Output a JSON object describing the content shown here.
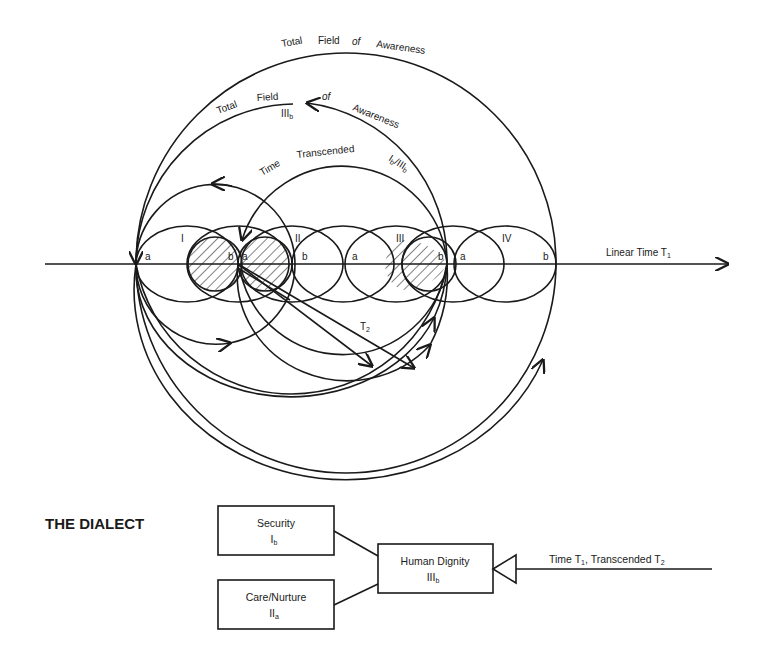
{
  "diagram": {
    "axis": {
      "label": "Linear Time T",
      "label_sub": "1"
    },
    "arcs": {
      "outer_label_words": [
        "Total",
        "Field",
        "of",
        "Awareness"
      ],
      "middle_label_left_words": [
        "Total",
        "Field"
      ],
      "middle_label_right_words": [
        "of",
        "Awareness"
      ],
      "middle_marker": "III",
      "middle_marker_sub": "b",
      "inner_label_words": [
        "Time",
        "Transcended"
      ],
      "inner_marker": "I",
      "inner_marker_sub": "b",
      "inner_marker_rest": "/III",
      "inner_marker_rest_sub": "b",
      "t2_label": "T",
      "t2_label_sub": "2"
    },
    "cycles": [
      {
        "numeral": "I",
        "start": "a",
        "end": "b"
      },
      {
        "numeral": "II",
        "start": "a",
        "end": "b"
      },
      {
        "numeral": "III",
        "start": "a",
        "end": "b"
      },
      {
        "numeral": "IV",
        "start": "a",
        "end": "b"
      }
    ]
  },
  "dialect": {
    "title": "THE DIALECT",
    "boxes": [
      {
        "name": "Security",
        "code": "I",
        "code_sub": "b"
      },
      {
        "name": "Care/Nurture",
        "code": "II",
        "code_sub": "a"
      },
      {
        "name": "Human Dignity",
        "code": "III",
        "code_sub": "b"
      }
    ],
    "input": {
      "text1": "Time T",
      "sub1": "1",
      "text2": ", Transcended T",
      "sub2": "2"
    }
  },
  "colors": {
    "ink": "#1a1a1a",
    "paper": "#ffffff"
  }
}
